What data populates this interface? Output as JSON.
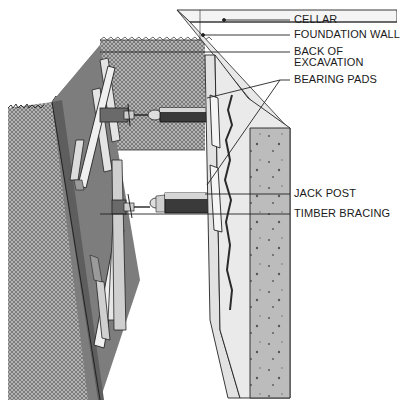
{
  "figure": {
    "colors": {
      "ink": "#1a1a1a",
      "soil_hatch": "#7a7a7a",
      "timber": "#eeeeee",
      "timber_dark": "#6e6e6e",
      "jack_dark": "#3a3a3a",
      "wall_face": "#e6e6e6",
      "wall_section": "#bdbdbd"
    }
  },
  "labels": {
    "cellar": "CELLAR",
    "foundation_wall": "FOUNDATION WALL",
    "back_of_excavation_line1": "BACK OF",
    "back_of_excavation_line2": "EXCAVATION",
    "bearing_pads": "BEARING PADS",
    "jack_post": "JACK POST",
    "timber_bracing": "TIMBER BRACING"
  }
}
